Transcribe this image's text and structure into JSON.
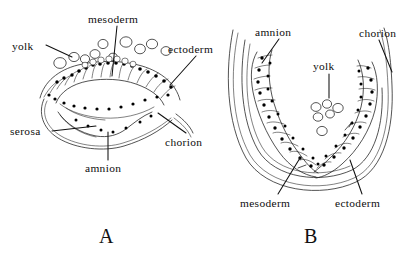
{
  "figure": {
    "background_color": "#ffffff",
    "ink_color": "#1a1a1a",
    "text_color": "#0d0d0d",
    "type": "line-drawing"
  },
  "panels": [
    {
      "id": "A",
      "letter": "A",
      "labels": [
        {
          "id": "yolk",
          "text": "yolk",
          "x": 12,
          "y": 50
        },
        {
          "id": "mesoderm",
          "text": "mesoderm",
          "x": 88,
          "y": 23
        },
        {
          "id": "ectoderm",
          "text": "ectoderm",
          "x": 168,
          "y": 53
        },
        {
          "id": "serosa",
          "text": "serosa",
          "x": 10,
          "y": 135
        },
        {
          "id": "chorion",
          "text": "chorion",
          "x": 165,
          "y": 146
        },
        {
          "id": "amnion",
          "text": "amnion",
          "x": 85,
          "y": 172
        }
      ]
    },
    {
      "id": "B",
      "letter": "B",
      "labels": [
        {
          "id": "amnion",
          "text": "amnion",
          "x": 255,
          "y": 36
        },
        {
          "id": "chorion",
          "text": "chorion",
          "x": 359,
          "y": 37
        },
        {
          "id": "yolk",
          "text": "yolk",
          "x": 313,
          "y": 70
        },
        {
          "id": "mesoderm",
          "text": "mesoderm",
          "x": 240,
          "y": 207
        },
        {
          "id": "ectoderm",
          "text": "ectoderm",
          "x": 335,
          "y": 207
        }
      ]
    }
  ],
  "caption_letters": [
    {
      "id": "A",
      "text": "A",
      "x": 99,
      "y": 243
    },
    {
      "id": "B",
      "text": "B",
      "x": 304,
      "y": 243
    }
  ]
}
